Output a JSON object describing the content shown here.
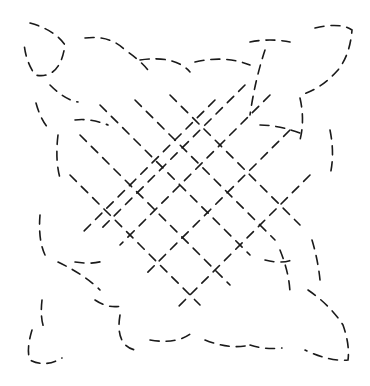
{
  "image": {
    "description": "Celtic knot line drawing rendered with dashed strokes",
    "width": 370,
    "height": 386,
    "background": "#ffffff",
    "stroke_color": "#1a1a1a"
  }
}
